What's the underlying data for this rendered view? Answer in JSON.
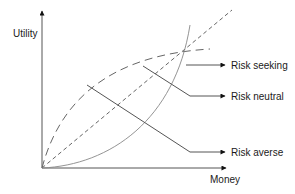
{
  "diagram": {
    "title": "",
    "axes": {
      "y_label": "Utility",
      "x_label": "Money"
    },
    "curves": [
      {
        "name": "risk-seeking",
        "style": "solid-thin",
        "shape": "convex"
      },
      {
        "name": "risk-neutral",
        "style": "short-dash",
        "shape": "linear"
      },
      {
        "name": "risk-averse",
        "style": "long-dash",
        "shape": "concave"
      }
    ],
    "labels": {
      "risk_seeking": "Risk seeking",
      "risk_neutral": "Risk neutral",
      "risk_averse": "Risk averse"
    },
    "colors": {
      "axis": "#555555",
      "curve": "#666666",
      "leader": "#555555",
      "text": "#1a1a1a"
    }
  }
}
